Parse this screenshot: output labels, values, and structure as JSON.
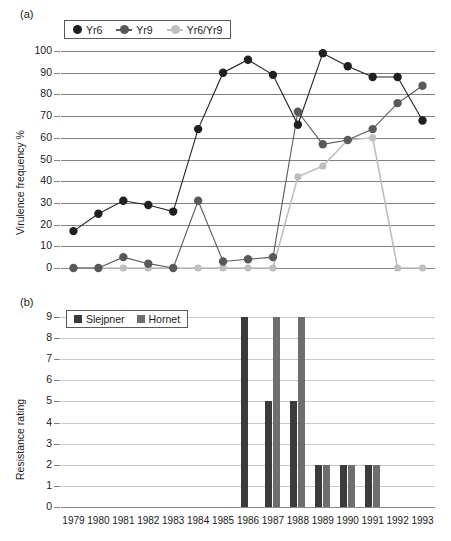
{
  "panel_a": {
    "tag": "(a)",
    "ylabel": "Virulence frequency %",
    "yticks": [
      "0",
      "10",
      "20",
      "30",
      "40",
      "50",
      "60",
      "70",
      "80",
      "90",
      "100"
    ],
    "legend": [
      {
        "label": "Yr6",
        "color": "#231f20",
        "style": "dot"
      },
      {
        "label": "Yr9",
        "color": "#58595b",
        "style": "line-dot"
      },
      {
        "label": "Yr6/Yr9",
        "color": "#bcbec0",
        "style": "line-dot"
      }
    ]
  },
  "panel_b": {
    "tag": "(b)",
    "ylabel": "Resistance rating",
    "yticks": [
      "0",
      "1",
      "2",
      "3",
      "4",
      "5",
      "6",
      "7",
      "8",
      "9"
    ],
    "legend": [
      {
        "label": "Slejpner",
        "color": "#3b3b3b"
      },
      {
        "label": "Hornet",
        "color": "#6e6e6e"
      }
    ]
  },
  "chart_data": [
    {
      "type": "line",
      "panel": "(a)",
      "title": "",
      "xlabel": "",
      "ylabel": "Virulence frequency %",
      "ylim": [
        0,
        100
      ],
      "ytick_step": 10,
      "grid": true,
      "legend_position": "top-left",
      "categories": [
        "1979",
        "1980",
        "1981",
        "1982",
        "1983",
        "1984",
        "1985",
        "1986",
        "1987",
        "1988",
        "1989",
        "1990",
        "1991",
        "1992",
        "1993"
      ],
      "series": [
        {
          "name": "Yr6",
          "color": "#231f20",
          "values": [
            17,
            25,
            31,
            29,
            26,
            64,
            90,
            96,
            89,
            66,
            99,
            93,
            88,
            88,
            68
          ]
        },
        {
          "name": "Yr9",
          "color": "#58595b",
          "values": [
            0,
            0,
            5,
            2,
            0,
            31,
            3,
            4,
            5,
            72,
            57,
            59,
            64,
            76,
            84
          ]
        },
        {
          "name": "Yr6/Yr9",
          "color": "#bcbec0",
          "values": [
            0,
            0,
            0,
            0,
            0,
            0,
            0,
            0,
            0,
            42,
            47,
            59,
            60,
            0,
            0
          ]
        }
      ]
    },
    {
      "type": "bar",
      "panel": "(b)",
      "title": "",
      "xlabel": "",
      "ylabel": "Resistance rating",
      "ylim": [
        0,
        9
      ],
      "ytick_step": 1,
      "grid": true,
      "legend_position": "top-left",
      "categories": [
        "1979",
        "1980",
        "1981",
        "1982",
        "1983",
        "1984",
        "1985",
        "1986",
        "1987",
        "1988",
        "1989",
        "1990",
        "1991",
        "1992",
        "1993"
      ],
      "series": [
        {
          "name": "Slejpner",
          "color": "#3b3b3b",
          "values": [
            null,
            null,
            null,
            null,
            null,
            null,
            null,
            9,
            5,
            5,
            2,
            2,
            2,
            null,
            null
          ]
        },
        {
          "name": "Hornet",
          "color": "#6e6e6e",
          "values": [
            null,
            null,
            null,
            null,
            null,
            null,
            null,
            null,
            9,
            9,
            2,
            2,
            2,
            null,
            null
          ]
        }
      ]
    }
  ],
  "xaxis": {
    "labels": [
      "1979",
      "1980",
      "1981",
      "1982",
      "1983",
      "1984",
      "1985",
      "1986",
      "1987",
      "1988",
      "1989",
      "1990",
      "1991",
      "1992",
      "1993"
    ]
  }
}
